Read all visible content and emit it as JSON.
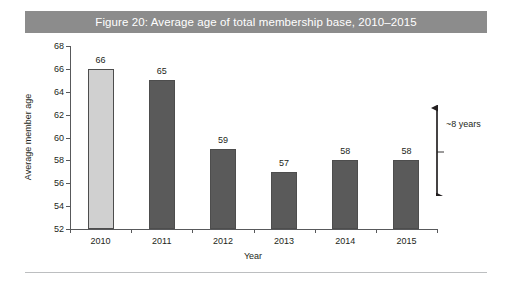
{
  "figure": {
    "title": "Figure 20: Average age of total membership base, 2010–2015",
    "title_bar_color": "#8c8c8c",
    "title_text_color": "#ffffff"
  },
  "chart_data": {
    "type": "bar",
    "title": "Figure 20: Average age of total membership base, 2010–2015",
    "xlabel": "Year",
    "ylabel": "Average member age",
    "categories": [
      "2010",
      "2011",
      "2012",
      "2013",
      "2014",
      "2015"
    ],
    "values": [
      66,
      65,
      59,
      57,
      58,
      58
    ],
    "data_labels": [
      "66",
      "65",
      "59",
      "57",
      "58",
      "58"
    ],
    "ylim": [
      52,
      68
    ],
    "ytick_step": 2,
    "yticks": [
      52,
      54,
      56,
      58,
      60,
      62,
      64,
      66,
      68
    ],
    "ytick_labels": [
      "52",
      "54",
      "56",
      "58",
      "60",
      "62",
      "64",
      "66",
      "68"
    ],
    "grid": false,
    "legend": false,
    "bar_colors": [
      "#d0d0d0",
      "#5a5a5a",
      "#5a5a5a",
      "#5a5a5a",
      "#5a5a5a",
      "#5a5a5a"
    ],
    "bar_border_color": "#4d4d4d",
    "highlight_category": "2010",
    "annotations": [
      {
        "text": "~8 years",
        "type": "double-headed-arrow",
        "from_value": 66,
        "to_value": 58
      }
    ]
  },
  "colors": {
    "axis": "#58595b",
    "divider": "#bcbec0",
    "text": "#231f20"
  }
}
